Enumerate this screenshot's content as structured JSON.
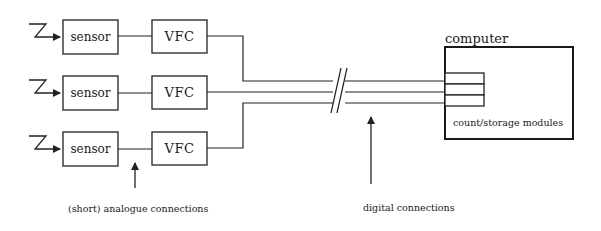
{
  "diagram": {
    "rows": [
      {
        "sensor_label": "sensor",
        "converter_label": "VFC"
      },
      {
        "sensor_label": "sensor",
        "converter_label": "VFC"
      },
      {
        "sensor_label": "sensor",
        "converter_label": "VFC"
      }
    ],
    "computer": {
      "label": "computer",
      "modules_label": "count/storage modules",
      "module_count": 3
    },
    "annotations": {
      "analogue": "(short) analogue connections",
      "digital": "digital connections"
    },
    "input_symbol": "lightning-input-icon",
    "line_break_symbol": "double-slash-break",
    "colors": {
      "line": "#222222",
      "background": "#ffffff"
    }
  }
}
